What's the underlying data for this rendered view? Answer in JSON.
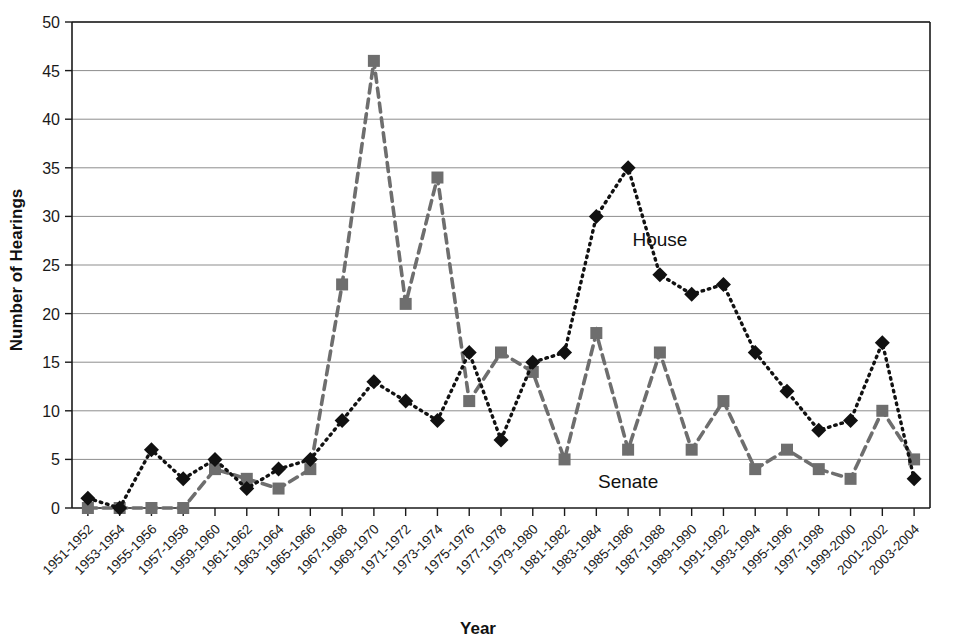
{
  "chart_data": {
    "type": "line",
    "title": "",
    "xlabel": "Year",
    "ylabel": "Number of Hearings",
    "ylim": [
      0,
      50
    ],
    "ytick_step": 5,
    "yticks": [
      "0",
      "5",
      "10",
      "15",
      "20",
      "25",
      "30",
      "35",
      "40",
      "45",
      "50"
    ],
    "grid": true,
    "legend_position": "inline-annotation",
    "categories": [
      "1951-1952",
      "1953-1954",
      "1955-1956",
      "1957-1958",
      "1959-1960",
      "1961-1962",
      "1963-1964",
      "1965-1966",
      "1967-1968",
      "1969-1970",
      "1971-1972",
      "1973-1974",
      "1975-1976",
      "1977-1978",
      "1979-1980",
      "1981-1982",
      "1983-1984",
      "1985-1986",
      "1987-1988",
      "1989-1990",
      "1991-1992",
      "1993-1994",
      "1995-1996",
      "1997-1998",
      "1999-2000",
      "2001-2002",
      "2003-2004"
    ],
    "series": [
      {
        "name": "House",
        "marker": "diamond",
        "line_style": "dotted",
        "color": "#111111",
        "values": [
          1,
          0,
          6,
          3,
          5,
          2,
          4,
          5,
          9,
          13,
          11,
          9,
          16,
          7,
          15,
          16,
          30,
          35,
          24,
          22,
          23,
          16,
          12,
          8,
          9,
          17,
          3
        ]
      },
      {
        "name": "Senate",
        "marker": "square",
        "line_style": "dashed",
        "color": "#6e6e6e",
        "values": [
          0,
          0,
          0,
          0,
          4,
          3,
          2,
          4,
          23,
          46,
          21,
          34,
          11,
          16,
          14,
          5,
          18,
          6,
          16,
          6,
          11,
          4,
          6,
          4,
          3,
          10,
          5
        ]
      }
    ],
    "annotations": [
      {
        "text": "House",
        "category": "1987-1988",
        "value": 27
      },
      {
        "text": "Senate",
        "category": "1985-1986",
        "value": 2.1
      }
    ]
  }
}
